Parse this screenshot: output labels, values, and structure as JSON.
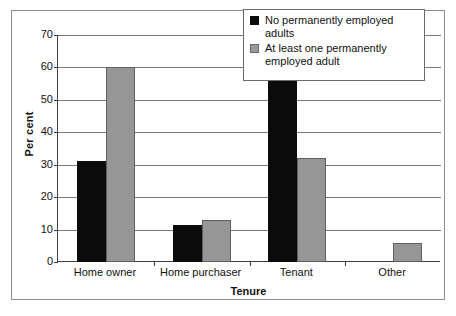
{
  "chart_data": {
    "type": "bar",
    "title": "",
    "xlabel": "Tenure",
    "ylabel": "Per cent",
    "categories": [
      "Home owner",
      "Home purchaser",
      "Tenant",
      "Other"
    ],
    "series": [
      {
        "name": "No permanently employed adults",
        "color": "#0b0b0b",
        "values": [
          31,
          11.5,
          57,
          0
        ]
      },
      {
        "name": "At least one permanently employed adult",
        "color": "#969696",
        "values": [
          60,
          13,
          32,
          6
        ]
      }
    ],
    "ylim": [
      0,
      70
    ],
    "yticks": [
      0,
      10,
      20,
      30,
      40,
      50,
      60,
      70
    ],
    "ytick_labels": [
      "0",
      "10",
      "20",
      "30",
      "40",
      "50",
      "60",
      "70"
    ],
    "grid": "horizontal",
    "legend_position": "top-right"
  },
  "legend": {
    "entries": [
      {
        "label": "No permanently employed adults",
        "swatch": "black-square-swatch"
      },
      {
        "label": "At least one permanently employed adult",
        "swatch": "grey-square-swatch"
      }
    ]
  }
}
